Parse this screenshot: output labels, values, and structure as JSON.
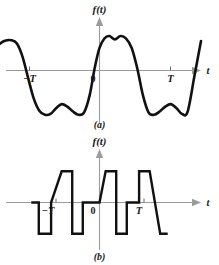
{
  "figure": {
    "width": 219,
    "height": 265,
    "background": "#ffffff",
    "curve_color": "#111111",
    "axis_color": "#9b9b9b",
    "text_color": "#1a1a1a"
  },
  "panels": [
    {
      "id": "a",
      "caption": "(a)",
      "y_axis_label": "f(t)",
      "x_axis_label": "t",
      "tick_labels": {
        "left": "−T",
        "origin": "0",
        "right": "T"
      }
    },
    {
      "id": "b",
      "caption": "(b)",
      "y_axis_label": "f(t)",
      "x_axis_label": "t",
      "tick_labels": {
        "left": "−T",
        "origin": "0",
        "right": "T"
      }
    }
  ],
  "chart_data": [
    {
      "type": "line",
      "id": "panel-a",
      "title": "(a)",
      "xlabel": "t",
      "ylabel": "f(t)",
      "grid": false,
      "legend": null,
      "description": "Periodic even waveform: flat-topped double-peaked positive humps centred at t = 0 and t = ±T, separated by double-dipped negative troughs; period T.",
      "xlim": [
        -1.45,
        1.45
      ],
      "ylim": [
        -1.25,
        1.0
      ],
      "xticks": [
        -1,
        0,
        1
      ],
      "xticklabels": [
        "−T",
        "0",
        "T"
      ],
      "annotations": [
        "−T",
        "0",
        "T",
        "f(t)",
        "t",
        "(a)"
      ],
      "x": [
        -1.45,
        -1.36,
        -1.26,
        -1.18,
        -1.1,
        -1.02,
        -0.94,
        -0.86,
        -0.78,
        -0.7,
        -0.62,
        -0.54,
        -0.46,
        -0.38,
        -0.3,
        -0.22,
        -0.14,
        -0.07,
        0.0,
        0.07,
        0.14,
        0.22,
        0.3,
        0.38,
        0.46,
        0.54,
        0.62,
        0.7,
        0.78,
        0.86,
        0.94,
        1.02,
        1.1,
        1.18,
        1.26,
        1.36,
        1.45
      ],
      "y": [
        0.62,
        0.72,
        0.74,
        0.66,
        0.34,
        -0.18,
        -0.68,
        -0.98,
        -1.08,
        -1.06,
        -0.92,
        -0.82,
        -0.88,
        -1.0,
        -1.08,
        -1.02,
        -0.6,
        0.05,
        0.55,
        0.78,
        0.84,
        0.76,
        0.84,
        0.78,
        0.55,
        0.05,
        -0.6,
        -1.02,
        -1.08,
        -1.0,
        -0.88,
        -0.82,
        -0.92,
        -1.06,
        -1.0,
        -0.1,
        0.72
      ],
      "series": [
        {
          "name": "f(t)",
          "values": [
            0.62,
            0.72,
            0.74,
            0.66,
            0.34,
            -0.18,
            -0.68,
            -0.98,
            -1.08,
            -1.06,
            -0.92,
            -0.82,
            -0.88,
            -1.0,
            -1.08,
            -1.02,
            -0.6,
            0.05,
            0.55,
            0.78,
            0.84,
            0.76,
            0.84,
            0.78,
            0.55,
            0.05,
            -0.6,
            -1.02,
            -1.08,
            -1.0,
            -0.88,
            -0.82,
            -0.92,
            -1.06,
            -1.0,
            -0.1,
            0.72
          ]
        }
      ]
    },
    {
      "type": "line",
      "id": "panel-b",
      "title": "(b)",
      "xlabel": "t",
      "ylabel": "f(t)",
      "grid": false,
      "legend": null,
      "description": "Periodic sawtooth/square composite: a linear ramp rises from the negative plateau up to a flat positive plateau, then drops vertically and ramps down to a flat negative plateau; repeats with period T.",
      "xlim": [
        -1.55,
        1.55
      ],
      "ylim": [
        -1.0,
        1.0
      ],
      "xticks": [
        -1,
        0,
        1
      ],
      "xticklabels": [
        "−T",
        "0",
        "T"
      ],
      "annotations": [
        "−T",
        "0",
        "T",
        "f(t)",
        "t",
        "(b)"
      ],
      "x": [
        -1.55,
        -1.38,
        -1.38,
        -1.1,
        -1.1,
        -0.86,
        -0.62,
        -0.62,
        -0.38,
        -0.38,
        -0.1,
        -0.1,
        0.0,
        0.14,
        0.38,
        0.38,
        0.62,
        0.62,
        0.9,
        0.9,
        1.14,
        1.38,
        1.38,
        1.55
      ],
      "y": [
        0.0,
        0.0,
        -0.78,
        -0.78,
        0.0,
        0.78,
        0.78,
        -0.78,
        -0.78,
        0.0,
        0.0,
        0.0,
        0.0,
        0.78,
        0.78,
        -0.78,
        -0.78,
        0.0,
        0.0,
        0.78,
        0.78,
        -0.78,
        -0.78,
        -0.78
      ],
      "series": [
        {
          "name": "f(t)",
          "values": [
            0.0,
            0.0,
            -0.78,
            -0.78,
            0.0,
            0.78,
            0.78,
            -0.78,
            -0.78,
            0.0,
            0.0,
            0.0,
            0.0,
            0.78,
            0.78,
            -0.78,
            -0.78,
            0.0,
            0.0,
            0.78,
            0.78,
            -0.78,
            -0.78,
            -0.78
          ]
        }
      ]
    }
  ]
}
